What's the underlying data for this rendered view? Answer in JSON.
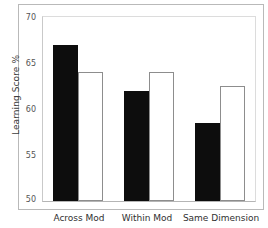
{
  "chart_data": {
    "type": "bar",
    "title": "",
    "subtitle": "",
    "xlabel": "",
    "ylabel": "Learning Score %",
    "categories": [
      "Across Mod",
      "Within Mod",
      "Same Dimension"
    ],
    "series": [
      {
        "name": "black-bar",
        "color": "#0d0d0d",
        "values": [
          67,
          62,
          58.5
        ]
      },
      {
        "name": "white-bar",
        "color": "#ffffff",
        "values": [
          64,
          64,
          62.5
        ]
      }
    ],
    "ylim": [
      50,
      70
    ],
    "yticks": [
      50,
      55,
      60,
      65,
      70
    ],
    "ytick_labels": [
      "50",
      "55",
      "60",
      "65",
      "70"
    ],
    "grid": false,
    "legend": "none",
    "bar_edge_color": "#8d8d8d"
  },
  "axis": {
    "y_title": "Learning Score %",
    "ticks": [
      {
        "label": "70",
        "value": 70
      },
      {
        "label": "65",
        "value": 65
      },
      {
        "label": "60",
        "value": 60
      },
      {
        "label": "55",
        "value": 55
      },
      {
        "label": "50",
        "value": 50
      }
    ]
  },
  "groups": [
    {
      "label": "Across Mod"
    },
    {
      "label": "Within Mod"
    },
    {
      "label": "Same Dimension"
    }
  ]
}
